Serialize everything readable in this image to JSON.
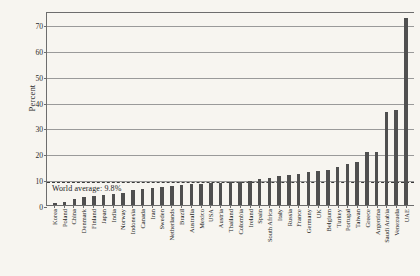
{
  "chart_data": {
    "type": "bar",
    "title": "",
    "subtitle": "",
    "xlabel": "",
    "ylabel": "Percent",
    "ylim": [
      0,
      75
    ],
    "ytick_labels": [
      "0",
      "10",
      "20",
      "30",
      "40",
      "50",
      "60",
      "70"
    ],
    "yticks": [
      0,
      10,
      20,
      30,
      40,
      50,
      60,
      70
    ],
    "grid": "horizontal",
    "legend": "none",
    "bar_color": "#4f4f4f",
    "background_color": "#f7f5f0",
    "axis_color": "#6d6d6d",
    "annotations": [
      {
        "name": "world-average",
        "label": "World average: 9.8%",
        "value": 9.8,
        "style": "dashed-horizontal-line"
      }
    ],
    "categories": [
      "Korea",
      "Poland",
      "China",
      "Denmark",
      "Finland",
      "Japan",
      "India",
      "Norway",
      "Indonesia",
      "Canada",
      "Iran",
      "Sweden",
      "Netherlands",
      "Brazil",
      "Australia",
      "Mexico",
      "USA",
      "Austria",
      "Thailand",
      "Colombia",
      "Ireland",
      "Spain",
      "South Africa",
      "Italy",
      "Russia",
      "France",
      "Germany",
      "UK",
      "Belgium",
      "Turkey",
      "Portugal",
      "Taiwan",
      "Greece",
      "Argentina",
      "Saudi Arabia",
      "Venezuela",
      "UAE"
    ],
    "values": [
      1.0,
      1.6,
      2.6,
      3.5,
      4.0,
      4.4,
      4.7,
      5.2,
      6.0,
      6.5,
      7.0,
      7.4,
      7.6,
      8.0,
      8.4,
      8.6,
      8.9,
      9.0,
      9.1,
      9.4,
      9.6,
      10.6,
      11.0,
      11.6,
      12.0,
      12.5,
      13.0,
      13.4,
      14.0,
      15.0,
      16.4,
      17.0,
      20.8,
      21.0,
      36.4,
      37.2,
      72.5
    ]
  }
}
